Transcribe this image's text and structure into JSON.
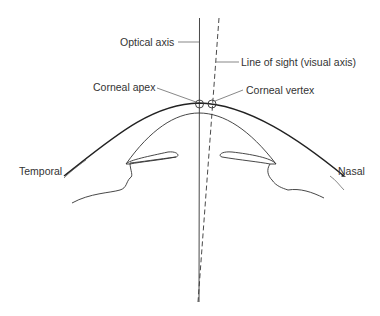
{
  "diagram": {
    "labels": {
      "optical_axis": "Optical axis",
      "line_of_sight": "Line of sight (visual axis)",
      "corneal_apex": "Corneal apex",
      "corneal_vertex": "Corneal vertex",
      "temporal": "Temporal",
      "nasal": "Nasal"
    },
    "colors": {
      "background": "#ffffff",
      "line": "#222222",
      "text": "#333333"
    }
  }
}
